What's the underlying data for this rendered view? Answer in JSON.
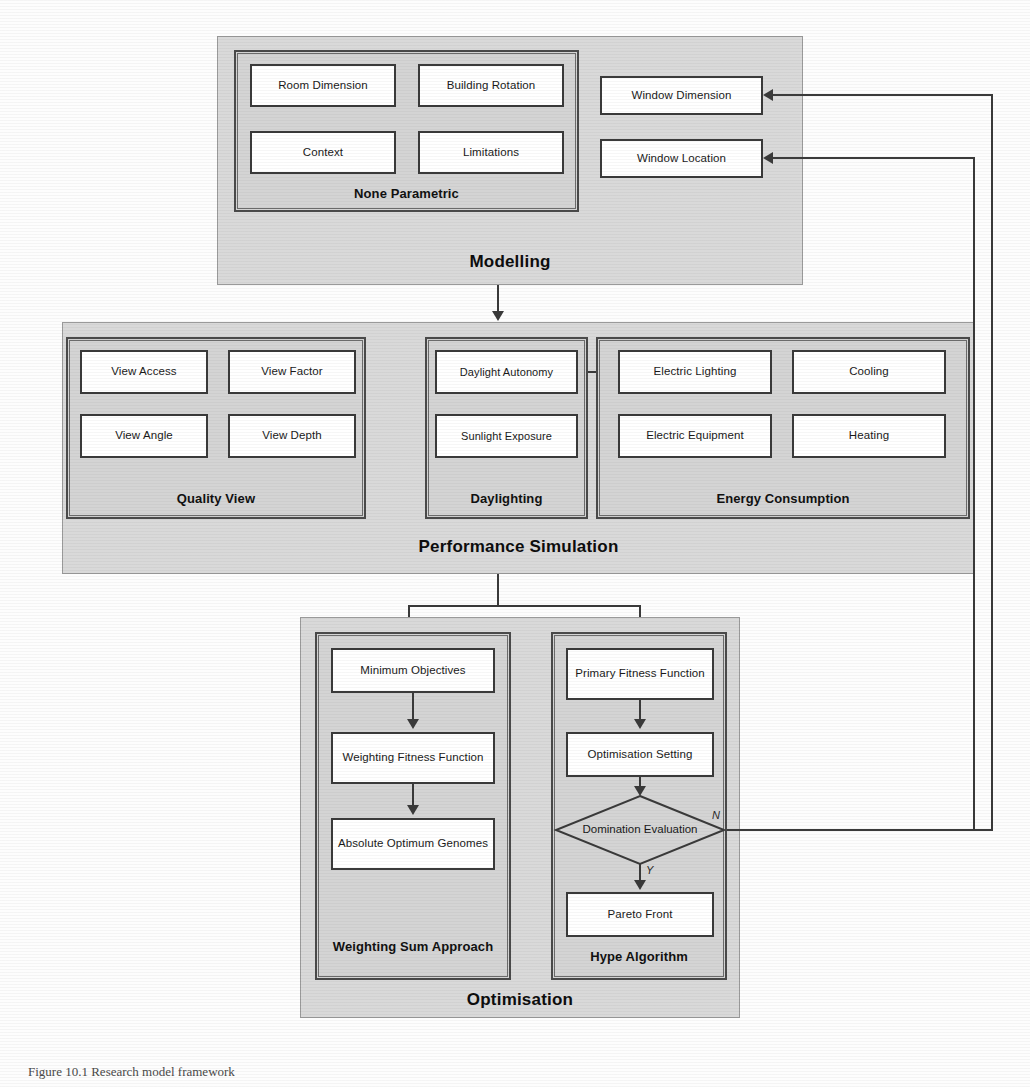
{
  "figure": {
    "caption": "Figure 10.1 Research model framework",
    "background_color": "#fdfdfd",
    "panel_color": "#d9d9d9",
    "group_color": "#d4d4d4",
    "leaf_color": "#ffffff",
    "line_color": "#3a3a3a"
  },
  "modelling": {
    "stage_label": "Modelling",
    "groups": [
      {
        "label": "None Parametric",
        "items": [
          "Room Dimension",
          "Building Rotation",
          "Context",
          "Limitations"
        ]
      }
    ],
    "parametric_items": [
      "Window Dimension",
      "Window Location"
    ]
  },
  "performance_simulation": {
    "stage_label": "Performance Simulation",
    "groups": [
      {
        "label": "Quality View",
        "items": [
          "View Access",
          "View Factor",
          "View Angle",
          "View Depth"
        ]
      },
      {
        "label": "Daylighting",
        "items": [
          "Daylight Autonomy",
          "Sunlight Exposure"
        ]
      },
      {
        "label": "Energy Consumption",
        "items": [
          "Electric Lighting",
          "Cooling",
          "Electric Equipment",
          "Heating"
        ]
      }
    ]
  },
  "optimisation": {
    "stage_label": "Optimisation",
    "groups": [
      {
        "label": "Weighting Sum Approach",
        "items": [
          "Minimum Objectives",
          "Weighting Fitness Function",
          "Absolute Optimum Genomes"
        ]
      },
      {
        "label": "Hype Algorithm",
        "items": [
          "Primary Fitness Function",
          "Optimisation Setting",
          "Pareto Front"
        ],
        "decision": "Domination Evaluation",
        "branch_no": "N",
        "branch_yes": "Y"
      }
    ]
  }
}
